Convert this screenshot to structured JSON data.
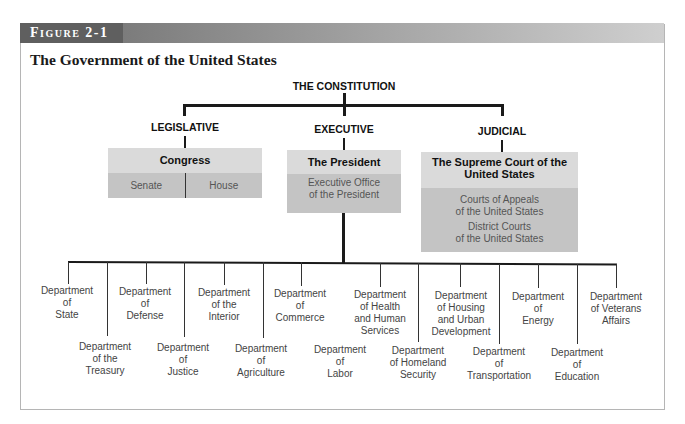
{
  "figure": {
    "label": "Figure 2-1",
    "title": "The Government of the United States"
  },
  "root": {
    "label": "THE CONSTITUTION"
  },
  "branches": {
    "legislative": {
      "heading": "LEGISLATIVE",
      "box_title": "Congress",
      "sub": [
        "Senate",
        "House"
      ]
    },
    "executive": {
      "heading": "EXECUTIVE",
      "box_title": "The President",
      "sub": "Executive Office\nof the President"
    },
    "judicial": {
      "heading": "JUDICIAL",
      "box_title": "The Supreme Court of the\nUnited States",
      "sub": [
        "Courts of Appeals\nof the United States",
        "District Courts\nof the United States"
      ]
    }
  },
  "departments": [
    {
      "label": "Department\nof\nState",
      "row": "upper"
    },
    {
      "label": "Department\nof the\nTreasury",
      "row": "lower"
    },
    {
      "label": "Department\nof\nDefense",
      "row": "upper"
    },
    {
      "label": "Department\nof\nJustice",
      "row": "lower"
    },
    {
      "label": "Department\nof  the\nInterior",
      "row": "upper"
    },
    {
      "label": "Department\nof\nAgriculture",
      "row": "lower"
    },
    {
      "label": "Department\nof\nCommerce",
      "row": "upper"
    },
    {
      "label": "Department\nof\nLabor",
      "row": "lower"
    },
    {
      "label": "Department\nof  Health\nand Human\nServices",
      "row": "upper"
    },
    {
      "label": "Department\nof Homeland\nSecurity",
      "row": "lower"
    },
    {
      "label": "Department\nof Housing\nand Urban\nDevelopment",
      "row": "upper"
    },
    {
      "label": "Department\nof\nTransportation",
      "row": "lower"
    },
    {
      "label": "Department\nof\nEnergy",
      "row": "upper"
    },
    {
      "label": "Department\nof\nEducation",
      "row": "lower"
    },
    {
      "label": "Department\nof Veterans\nAffairs",
      "row": "upper"
    }
  ],
  "colors": {
    "box_header": "#dadada",
    "box_body": "#c4c4c4",
    "figure_bar": "#6b6b6b"
  }
}
